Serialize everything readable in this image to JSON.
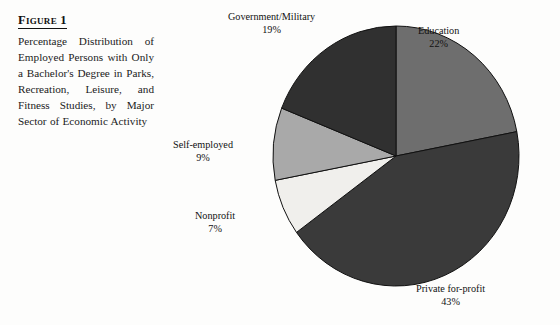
{
  "figure": {
    "label": "Figure 1",
    "caption": "Percentage Distribution of Employed Persons with Only a Bachelor's Degree in Parks, Recreation, Leisure, and Fitness Studies, by Major Sector of Economic Activity"
  },
  "labels": {
    "education": {
      "name": "Education",
      "pct": "22%"
    },
    "private": {
      "name": "Private for-profit",
      "pct": "43%"
    },
    "nonprofit": {
      "name": "Nonprofit",
      "pct": "7%"
    },
    "selfemployed": {
      "name": "Self-employed",
      "pct": "9%"
    },
    "government": {
      "name": "Government/Military",
      "pct": "19%"
    }
  },
  "chart_data": {
    "type": "pie",
    "title": "Percentage Distribution of Employed Persons with Only a Bachelor's Degree in Parks, Recreation, Leisure, and Fitness Studies, by Major Sector of Economic Activity",
    "xlabel": "",
    "ylabel": "",
    "units": "percent",
    "start_angle_deg": 0,
    "direction": "clockwise",
    "legend": "none",
    "grid": false,
    "labels_on_slices": false,
    "labels_outside": true,
    "categories": [
      "Education",
      "Private for-profit",
      "Nonprofit",
      "Self-employed",
      "Government/Military"
    ],
    "values": [
      22,
      43,
      7,
      9,
      19
    ],
    "total": 100,
    "slices": [
      {
        "label": "Education",
        "value": 22,
        "display": "22%",
        "color": "#6e6e6e",
        "start_deg": 0.0,
        "end_deg": 79.2
      },
      {
        "label": "Private for-profit",
        "value": 43,
        "display": "43%",
        "color": "#3a3a3a",
        "start_deg": 79.2,
        "end_deg": 234.0
      },
      {
        "label": "Nonprofit",
        "value": 7,
        "display": "7%",
        "color": "#f0efec",
        "start_deg": 234.0,
        "end_deg": 259.2
      },
      {
        "label": "Self-employed",
        "value": 9,
        "display": "9%",
        "color": "#a9a9a9",
        "start_deg": 259.2,
        "end_deg": 291.6
      },
      {
        "label": "Government/Military",
        "value": 19,
        "display": "19%",
        "color": "#303030",
        "start_deg": 291.6,
        "end_deg": 360.0
      }
    ]
  }
}
